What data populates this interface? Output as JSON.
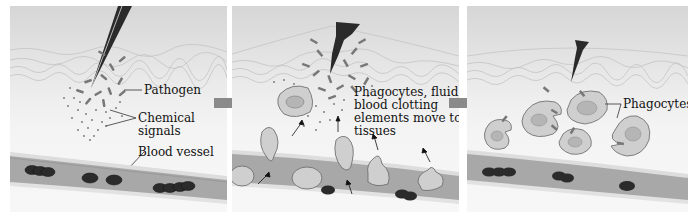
{
  "figure": {
    "panels": [
      {
        "id": "injury",
        "labels": {
          "pathogen": "Pathogen",
          "chemical_signals_line1": "Chemical",
          "chemical_signals_line2": "signals",
          "blood_vessel": "Blood vessel"
        }
      },
      {
        "id": "migration",
        "labels": {
          "line1": "Phagocytes, fluid,",
          "line2": "blood clotting",
          "line3": "elements move to",
          "line4": "tissues"
        }
      },
      {
        "id": "phagocytosis",
        "labels": {
          "phagocytes": "Phagocytes"
        }
      }
    ],
    "arrows": [
      "panel1-to-panel2",
      "panel2-to-panel3"
    ],
    "colors": {
      "arrow": "#8a8a8a",
      "vessel": "#a9a9a9",
      "red_blood_cell": "#2b2b2b",
      "phagocyte": "#c9c9c9",
      "skin_line": "#bdbdbd"
    }
  }
}
